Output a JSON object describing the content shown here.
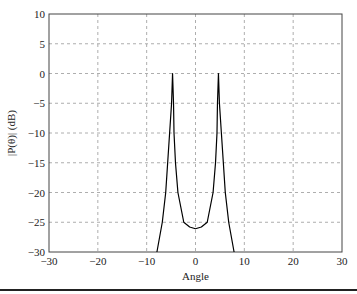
{
  "chart_data": {
    "type": "line",
    "title": "",
    "xlabel": "Angle",
    "ylabel": "|P(θ)| (dB)",
    "xlim": [
      -30,
      30
    ],
    "ylim": [
      -30,
      10
    ],
    "xticks": [
      -30,
      -20,
      -10,
      0,
      10,
      20,
      30
    ],
    "yticks": [
      10,
      5,
      0,
      -5,
      -10,
      -15,
      -20,
      -25,
      -30
    ],
    "grid": true,
    "series": [
      {
        "name": "pattern",
        "color": "#000000",
        "x": [
          -7.9,
          -6.8,
          -6.1,
          -5.7,
          -5.3,
          -4.9,
          -4.7,
          -4.5,
          -4.4,
          -4.1,
          -3.6,
          -2.4,
          -1.2,
          0,
          1.2,
          2.4,
          3.6,
          4.1,
          4.4,
          4.5,
          4.7,
          4.9,
          5.3,
          5.7,
          6.1,
          6.8,
          7.9
        ],
        "y": [
          -30,
          -25,
          -20,
          -15,
          -10,
          -5,
          0,
          -5,
          -10,
          -15,
          -20,
          -25,
          -25.8,
          -26.1,
          -25.8,
          -25,
          -20,
          -15,
          -10,
          -5,
          0,
          -5,
          -10,
          -15,
          -20,
          -25,
          -30
        ]
      }
    ]
  }
}
